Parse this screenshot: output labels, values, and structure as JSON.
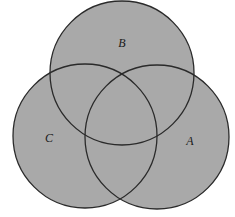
{
  "diagram": {
    "type": "venn",
    "set_count": 3,
    "colors": {
      "background": "#ffffff",
      "fill": "#a9a9a9",
      "outline": "#2a2a2a",
      "label": "#1a1a1a"
    },
    "sets": [
      {
        "label": "A",
        "cx": 157,
        "cy": 137,
        "r": 72,
        "label_x": 190,
        "label_y": 142
      },
      {
        "label": "B",
        "cx": 122,
        "cy": 73,
        "r": 72,
        "label_x": 122,
        "label_y": 44
      },
      {
        "label": "C",
        "cx": 85,
        "cy": 136,
        "r": 72,
        "label_x": 49,
        "label_y": 139
      }
    ]
  }
}
